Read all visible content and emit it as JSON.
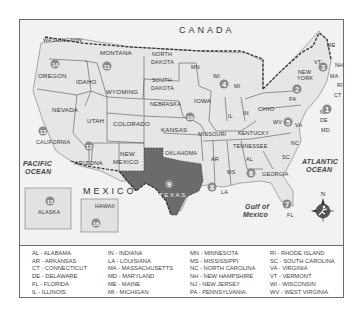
{
  "map": {
    "region_labels": {
      "canada": "CANADA",
      "mexico": "MEXICO"
    },
    "oceans": {
      "pacific": [
        "PACIFIC",
        "OCEAN"
      ],
      "atlantic": [
        "ATLANTIC",
        "OCEAN"
      ],
      "gulf": [
        "Gulf of",
        "Mexico"
      ]
    },
    "states": {
      "washington": "WASHINGTON",
      "oregon": "OREGON",
      "california": "CALIFORNIA",
      "nevada": "NEVADA",
      "idaho": "IDAHO",
      "montana": "MONTANA",
      "wyoming": "WYOMING",
      "utah": "UTAH",
      "colorado": "COLORADO",
      "arizona": "ARIZONA",
      "new_mexico": [
        "NEW",
        "MEXICO"
      ],
      "north_dakota": [
        "NORTH",
        "DAKOTA"
      ],
      "south_dakota": [
        "SOUTH",
        "DAKOTA"
      ],
      "nebraska": "NEBRASKA",
      "kansas": "KANSAS",
      "oklahoma": "OKLAHOMA",
      "texas": "TEXAS",
      "mn": "MN",
      "iowa": "IOWA",
      "missouri": "MISSOURI",
      "ar": "AR",
      "la": "LA",
      "wi": "WI",
      "il": "IL",
      "mi": "MI",
      "in": "IN",
      "ohio": "OHIO",
      "kentucky": "KENTUCKY",
      "tennessee": "TENNESSEE",
      "ms": "MS",
      "al": "AL",
      "georgia": "GEORGIA",
      "fl": "FL",
      "sc": "SC",
      "nc": "NC",
      "va": "VA",
      "wv": "WV",
      "pa": "PA",
      "new_york": [
        "NEW",
        "YORK"
      ],
      "vt": "VT",
      "nh": "NH",
      "me": "ME",
      "ma": "MA",
      "ri": "RI",
      "ct": "CT",
      "nj": "NJ",
      "de": "DE",
      "md": "MD",
      "alaska": "ALASKA",
      "hawaii": "HAWAII"
    },
    "markers": [
      "1",
      "2",
      "3",
      "4",
      "5",
      "6",
      "7",
      "8",
      "9",
      "10",
      "11",
      "12",
      "13",
      "14",
      "15",
      "16"
    ],
    "compass": {
      "north": "N"
    },
    "colors": {
      "land": "#e9e9e9",
      "texas": "#6b6b6b",
      "marker": "#8a8a8a",
      "compass": "#555555"
    }
  },
  "legend": {
    "columns": [
      [
        "AL - ALABAMA",
        "AR - ARKANSAS",
        "CT - CONNECTICUT",
        "DE - DELAWARE",
        "FL - FLORIDA",
        "IL - ILLINOIS"
      ],
      [
        "IN - INDIANA",
        "LA - LOUISIANA",
        "MA - MASSACHUSETTS",
        "MD - MARYLAND",
        "ME - MAINE",
        "MI - MICHIGAN"
      ],
      [
        "MN - MINNESOTA",
        "MS - MISSISSIPPI",
        "NC - NORTH CAROLINA",
        "NH - NEW HAMPSHIRE",
        "NJ - NEW JERSEY",
        "PA - PENNSYLVANIA"
      ],
      [
        "RI - RHODE ISLAND",
        "SC - SOUTH CAROLINA",
        "VA - VIRGINIA",
        "VT - VERMONT",
        "WI - WISCONSIN",
        "WV - WEST VIRGINIA"
      ]
    ]
  }
}
